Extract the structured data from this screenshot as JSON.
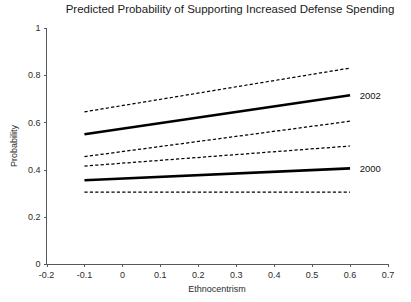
{
  "chart_data": {
    "type": "line",
    "title": "Predicted Probability of Supporting Increased Defense Spending",
    "xlabel": "Ethnocentrism",
    "ylabel": "Probability",
    "xlim": [
      -0.2,
      0.7
    ],
    "ylim": [
      0,
      1
    ],
    "xticks": [
      -0.2,
      -0.1,
      0,
      0.1,
      0.2,
      0.3,
      0.4,
      0.5,
      0.6,
      0.7
    ],
    "xticklabels": [
      "-0.2",
      "-0.1",
      "0",
      "0.1",
      "0.2",
      "0.3",
      "0.4",
      "0.5",
      "0.6",
      "0.7"
    ],
    "yticks": [
      0,
      0.2,
      0.4,
      0.6,
      0.8,
      1
    ],
    "yticklabels": [
      "0",
      "0.2",
      "0.4",
      "0.6",
      "0.8",
      "1"
    ],
    "grid": false,
    "legend_position": "right-inline",
    "x": [
      -0.1,
      0.6
    ],
    "series": [
      {
        "name": "2002",
        "style": "solid",
        "label": "2002",
        "label_x": 0.615,
        "label_y": 0.715,
        "values": [
          0.55,
          0.715
        ]
      },
      {
        "name": "2002 upper 95% CI",
        "style": "dashed",
        "label": "",
        "values": [
          0.645,
          0.83
        ]
      },
      {
        "name": "2002 lower 95% CI",
        "style": "dashed",
        "label": "",
        "values": [
          0.455,
          0.605
        ]
      },
      {
        "name": "2000",
        "style": "solid",
        "label": "2000",
        "label_x": 0.615,
        "label_y": 0.405,
        "values": [
          0.355,
          0.405
        ]
      },
      {
        "name": "2000 upper 95% CI",
        "style": "dashed",
        "label": "",
        "values": [
          0.415,
          0.5
        ]
      },
      {
        "name": "2000 lower 95% CI",
        "style": "dashed",
        "label": "",
        "values": [
          0.305,
          0.305
        ]
      }
    ]
  }
}
